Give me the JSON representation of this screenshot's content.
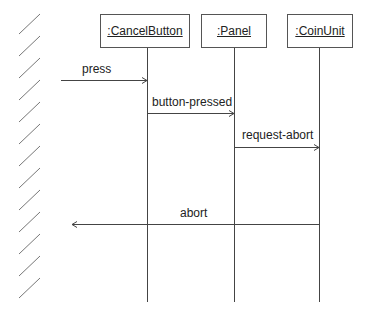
{
  "diagram": {
    "type": "sequence",
    "actor": {
      "name": "environment-boundary",
      "style": "hatched-wall"
    },
    "objects": [
      {
        "id": "cancel",
        "label": ":CancelButton"
      },
      {
        "id": "panel",
        "label": ":Panel"
      },
      {
        "id": "coin",
        "label": ":CoinUnit"
      }
    ],
    "messages": [
      {
        "label": "press",
        "from": "environment",
        "to": ":CancelButton"
      },
      {
        "label": "button-pressed",
        "from": ":CancelButton",
        "to": ":Panel"
      },
      {
        "label": "request-abort",
        "from": ":Panel",
        "to": ":CoinUnit"
      },
      {
        "label": "abort",
        "from": ":CoinUnit",
        "to": "environment"
      }
    ],
    "colors": {
      "line": "#444444",
      "text": "#222222",
      "background": "#ffffff"
    }
  }
}
